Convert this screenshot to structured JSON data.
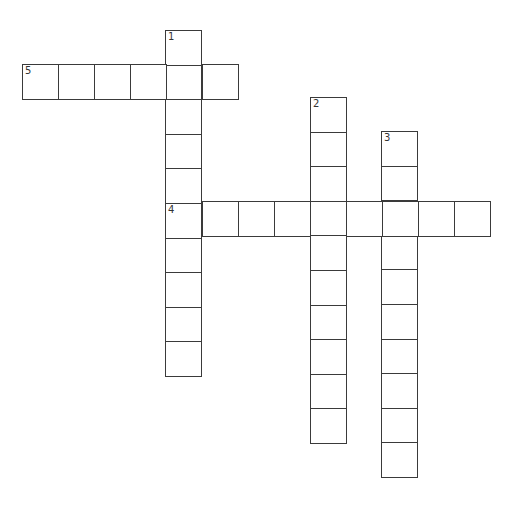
{
  "puzzle": {
    "type": "crossword",
    "cell_width": 36,
    "cell_height": 34.6,
    "line_color": "#3a3a3a",
    "entries": [
      {
        "number": "1",
        "direction": "down",
        "x": 165,
        "y": 30,
        "length": 10
      },
      {
        "number": "2",
        "direction": "down",
        "x": 310,
        "y": 97,
        "length": 10
      },
      {
        "number": "3",
        "direction": "down",
        "x": 381,
        "y": 131,
        "length": 10
      },
      {
        "number": "4",
        "direction": "across",
        "x": 166,
        "y": 201,
        "length": 9
      },
      {
        "number": "5",
        "direction": "across",
        "x": 22,
        "y": 64,
        "length": 6
      }
    ]
  }
}
